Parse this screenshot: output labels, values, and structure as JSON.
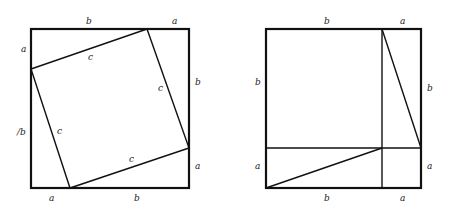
{
  "figure": {
    "stroke_color": "#111111",
    "left_panel": {
      "outer_square": {
        "x1": 31,
        "y1": 29,
        "x2": 189,
        "y2": 188
      },
      "inner_square": [
        [
          147,
          29
        ],
        [
          31,
          69
        ],
        [
          70,
          188
        ],
        [
          189,
          148
        ]
      ],
      "labels": [
        {
          "text": "b",
          "x": 86,
          "y": 24
        },
        {
          "text": "a",
          "x": 172,
          "y": 24
        },
        {
          "text": "a",
          "x": 21,
          "y": 52
        },
        {
          "text": "b",
          "x": 195,
          "y": 85
        },
        {
          "text": "c",
          "x": 88,
          "y": 60
        },
        {
          "text": "c",
          "x": 158,
          "y": 91
        },
        {
          "text": "c",
          "x": 57,
          "y": 134
        },
        {
          "text": "/b",
          "x": 17,
          "y": 135
        },
        {
          "text": "c",
          "x": 129,
          "y": 162
        },
        {
          "text": "a",
          "x": 195,
          "y": 169
        },
        {
          "text": "a",
          "x": 49,
          "y": 201
        },
        {
          "text": "b",
          "x": 134,
          "y": 201
        }
      ]
    },
    "right_panel": {
      "outer_square": {
        "x1": 266,
        "y1": 29,
        "x2": 421,
        "y2": 188
      },
      "vertical_divider_x": 382,
      "horizontal_divider_y": 148,
      "diagonals": [
        [
          [
            382,
            29
          ],
          [
            421,
            148
          ]
        ],
        [
          [
            266,
            188
          ],
          [
            382,
            148
          ]
        ]
      ],
      "labels": [
        {
          "text": "b",
          "x": 324,
          "y": 24
        },
        {
          "text": "a",
          "x": 400,
          "y": 24
        },
        {
          "text": "b",
          "x": 255,
          "y": 85
        },
        {
          "text": "b",
          "x": 427,
          "y": 91
        },
        {
          "text": "a",
          "x": 255,
          "y": 169
        },
        {
          "text": "a",
          "x": 427,
          "y": 169
        },
        {
          "text": "b",
          "x": 324,
          "y": 201
        },
        {
          "text": "a",
          "x": 400,
          "y": 201
        }
      ]
    }
  }
}
